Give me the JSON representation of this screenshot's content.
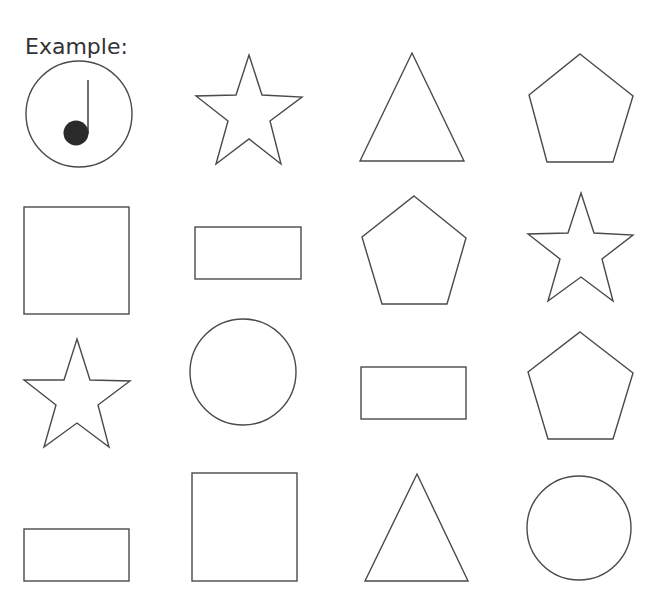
{
  "worksheet": {
    "example_label": "Example:",
    "stroke_color": "#4a4a4a",
    "example": {
      "shape": "circle",
      "mark": "quarter-note",
      "row": 1,
      "col": 1
    },
    "grid": [
      [
        "circle-with-note",
        "star",
        "triangle",
        "pentagon"
      ],
      [
        "square",
        "rectangle",
        "pentagon",
        "star"
      ],
      [
        "star",
        "circle",
        "rectangle",
        "pentagon"
      ],
      [
        "rectangle",
        "square",
        "triangle",
        "circle"
      ]
    ]
  }
}
